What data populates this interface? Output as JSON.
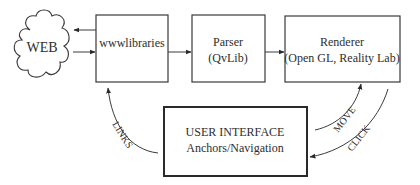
{
  "diagram": {
    "nodes": {
      "web": {
        "label": "WEB"
      },
      "wwwlibraries": {
        "label": "wwwlibraries"
      },
      "parser": {
        "line1": "Parser",
        "line2": "(QvLib)"
      },
      "renderer": {
        "line1": "Renderer",
        "line2": "(Open GL, Reality Lab)"
      },
      "user_interface": {
        "line1": "USER INTERFACE",
        "line2": "Anchors/Navigation"
      }
    },
    "edges": {
      "links": {
        "label": "LINKS"
      },
      "move": {
        "label": "MOVE"
      },
      "click": {
        "label": "CLICK"
      }
    },
    "colors": {
      "stroke": "#3a3a3a",
      "text": "#2e2e2e",
      "background": "#ffffff"
    }
  }
}
